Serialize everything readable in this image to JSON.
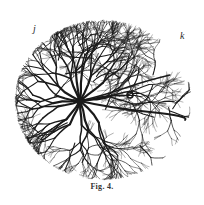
{
  "figure": {
    "caption": "Fig. 4.",
    "labels": {
      "j": "j",
      "k": "k"
    },
    "ink_color": "#1a1a1a",
    "background_color": "#ffffff",
    "disc": {
      "cx": 103,
      "cy": 100,
      "rx": 88,
      "ry": 80
    },
    "origin_point": {
      "x": 80,
      "y": 101
    },
    "ring_marker": {
      "x": 130,
      "y": 95,
      "r": 3
    }
  }
}
